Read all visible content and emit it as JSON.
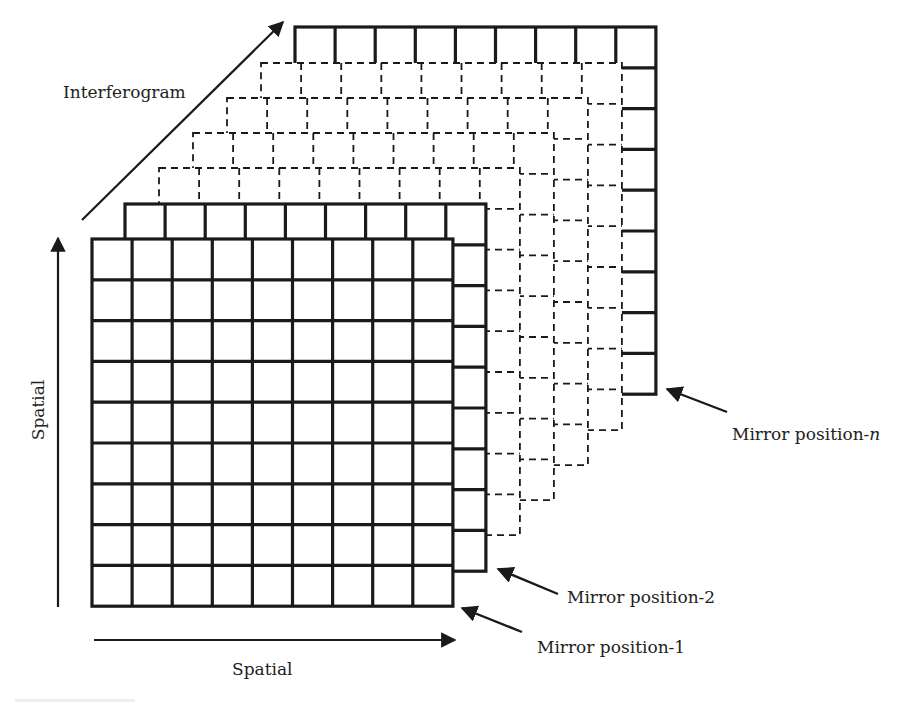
{
  "diagram": {
    "colors": {
      "stroke": "#1a1a1a",
      "text": "#222222",
      "background": "#ffffff",
      "caption_bar": "#eeeeee"
    },
    "grid": {
      "rows": 9,
      "cols": 9,
      "cell_w": 40.1,
      "cell_h": 40.8
    },
    "layers": [
      {
        "id": "mirror-position-n",
        "x": 295,
        "y": 27,
        "style": "solid"
      },
      {
        "id": "intermediate-4",
        "x": 261,
        "y": 63,
        "style": "dashed"
      },
      {
        "id": "intermediate-3",
        "x": 227,
        "y": 98,
        "style": "dashed"
      },
      {
        "id": "intermediate-2",
        "x": 193,
        "y": 133,
        "style": "dashed"
      },
      {
        "id": "intermediate-1",
        "x": 159,
        "y": 168,
        "style": "dashed"
      },
      {
        "id": "mirror-position-2",
        "x": 125,
        "y": 204,
        "style": "solid"
      },
      {
        "id": "mirror-position-1",
        "x": 92,
        "y": 239,
        "style": "solid"
      }
    ],
    "axes": {
      "interferogram": {
        "label": "Interferogram",
        "from": [
          82,
          220
        ],
        "to": [
          283,
          22
        ],
        "label_x": 63,
        "label_y": 98
      },
      "spatial_vertical": {
        "label": "Spatial",
        "from": [
          58,
          607
        ],
        "to": [
          58,
          238
        ],
        "label_x": 44,
        "label_y": 410
      },
      "spatial_horizontal": {
        "label": "Spatial",
        "from": [
          94,
          640
        ],
        "to": [
          455,
          640
        ],
        "label_x": 232,
        "label_y": 675
      }
    },
    "callouts": [
      {
        "label_main": "Mirror position-",
        "label_suffix": "n",
        "suffix_italic": true,
        "from": [
          727,
          412
        ],
        "to": [
          667,
          389
        ],
        "label_x": 732,
        "label_y": 440
      },
      {
        "label_main": "Mirror position-2",
        "label_suffix": "",
        "suffix_italic": false,
        "from": [
          558,
          594
        ],
        "to": [
          498,
          569
        ],
        "label_x": 567,
        "label_y": 603
      },
      {
        "label_main": "Mirror position-1",
        "label_suffix": "",
        "suffix_italic": false,
        "from": [
          522,
          632
        ],
        "to": [
          462,
          608
        ],
        "label_x": 537,
        "label_y": 653
      }
    ]
  }
}
